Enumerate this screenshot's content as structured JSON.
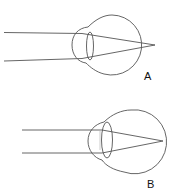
{
  "diagram": {
    "title": "",
    "panels": [
      {
        "id": "A",
        "label": "A",
        "description": "Eye with light rays converging at focal point behind retina",
        "eyeball": {
          "cx": 112,
          "cy": 45,
          "r": 30
        },
        "focal_point": {
          "x": 155,
          "y": 45
        }
      },
      {
        "id": "B",
        "label": "B",
        "description": "Eye with thicker lens and parallel rays converging on retina",
        "eyeball": {
          "cx": 131,
          "cy": 141,
          "r": 32
        },
        "focal_point": {
          "x": 163,
          "y": 141
        }
      }
    ],
    "colors": {
      "line": "#555555",
      "label": "#111111",
      "background": "#ffffff"
    }
  }
}
